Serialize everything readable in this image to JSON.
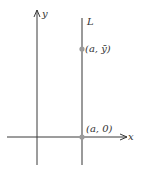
{
  "diagram": {
    "axes": {
      "x_label": "x",
      "y_label": "y",
      "color": "#3a3a3a"
    },
    "line": {
      "label": "L",
      "color": "#9a9a9a",
      "description": "vertical line x = a"
    },
    "points": [
      {
        "label": "(a, ȳ)",
        "color": "#9a9a9a"
      },
      {
        "label": "(a, 0)",
        "color": "#9a9a9a"
      }
    ]
  }
}
